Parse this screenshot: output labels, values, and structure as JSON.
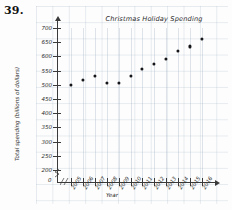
{
  "problem": {
    "number": "39."
  },
  "chart_data": {
    "type": "scatter",
    "title": "Christmas Holiday Spending",
    "xlabel": "Year",
    "ylabel": "Total spending (billions of dollars)",
    "categories": [
      "2005",
      "2006",
      "2007",
      "2008",
      "2009",
      "2010",
      "2011",
      "2012",
      "2013",
      "2014",
      "2015",
      "2016"
    ],
    "values": [
      500,
      518,
      530,
      505,
      507,
      532,
      556,
      572,
      592,
      620,
      635,
      660
    ],
    "x": [
      2005,
      2006,
      2007,
      2008,
      2009,
      2010,
      2011,
      2012,
      2013,
      2014,
      2015,
      2016
    ],
    "ylim": [
      200,
      700
    ],
    "yticks": [
      700,
      650,
      600,
      550,
      500,
      450,
      400,
      350,
      300,
      250,
      200
    ],
    "ytick_labels": [
      "700",
      "650",
      "600",
      "550",
      "500",
      "450",
      "400",
      "350",
      "300",
      "250",
      "200"
    ],
    "origin_label": "0",
    "grid": true,
    "legend": null,
    "axis_break": true,
    "marker": "filled-circle",
    "marker_color": "#16161a",
    "grid_color": "#96aabe",
    "axis_color": "#3a3a3a"
  }
}
